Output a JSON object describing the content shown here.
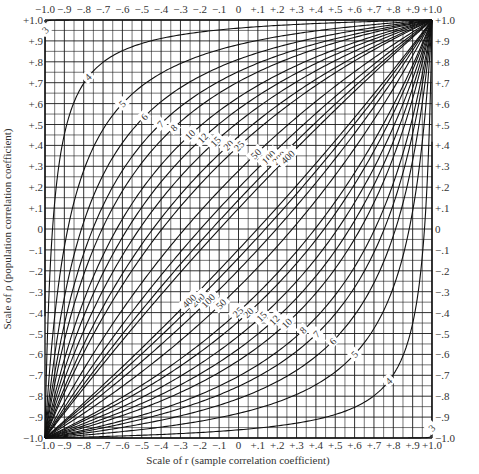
{
  "chart_data": {
    "type": "line",
    "title": "",
    "xlabel": "Scale of r (sample correlation coefficient)",
    "ylabel": "Scale of ρ (population correlation coefficient)",
    "xlim": [
      -1.0,
      1.0
    ],
    "ylim": [
      -1.0,
      1.0
    ],
    "grid": true,
    "grid_major_step": 0.1,
    "grid_minor_step": 0.05,
    "legend": "none (curves labeled inline)",
    "x_tick_labels": [
      "−1.0",
      "−.9",
      "−.8",
      "−.7",
      "−.6",
      "−.5",
      "−.4",
      "−.3",
      "−.2",
      "−.1",
      "0",
      "+.1",
      "+.2",
      "+.3",
      "+.4",
      "+.5",
      "+.6",
      "+.7",
      "+.8",
      "+.9",
      "+1.0"
    ],
    "y_tick_labels": [
      "+1.0",
      "+.9",
      "+.8",
      "+.7",
      "+.6",
      "+.5",
      "+.4",
      "+.3",
      "+.2",
      "+.1",
      "0",
      "−.1",
      "−.2",
      "−.3",
      "−.4",
      "−.5",
      "−.6",
      "−.7",
      "−.8",
      "−.9",
      "−1.0"
    ],
    "series": [
      {
        "name": "3",
        "n": 3
      },
      {
        "name": "4",
        "n": 4
      },
      {
        "name": "5",
        "n": 5
      },
      {
        "name": "6",
        "n": 6
      },
      {
        "name": "7",
        "n": 7
      },
      {
        "name": "8",
        "n": 8
      },
      {
        "name": "10",
        "n": 10
      },
      {
        "name": "12",
        "n": 12
      },
      {
        "name": "15",
        "n": 15
      },
      {
        "name": "20",
        "n": 20
      },
      {
        "name": "25",
        "n": 25
      },
      {
        "name": "50",
        "n": 50
      },
      {
        "name": "100",
        "n": 100
      },
      {
        "name": "200",
        "n": 200
      },
      {
        "name": "400",
        "n": 400
      }
    ],
    "confidence_z": 1.96
  },
  "colors": {
    "background": "#ffffff",
    "grid": "#1a1a1a",
    "curve": "#111111",
    "text": "#333333"
  }
}
